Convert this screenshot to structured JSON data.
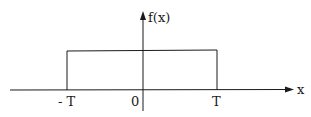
{
  "diagram": {
    "type": "rectangular-pulse",
    "axes": {
      "x_label": "x",
      "y_label": "f(x)"
    },
    "ticks": {
      "neg_T": "- T",
      "origin": "0",
      "pos_T": "T"
    },
    "pulse": {
      "from": "-T",
      "to": "T"
    },
    "colors": {
      "stroke": "#1a1a1a",
      "background": "#ffffff"
    }
  }
}
